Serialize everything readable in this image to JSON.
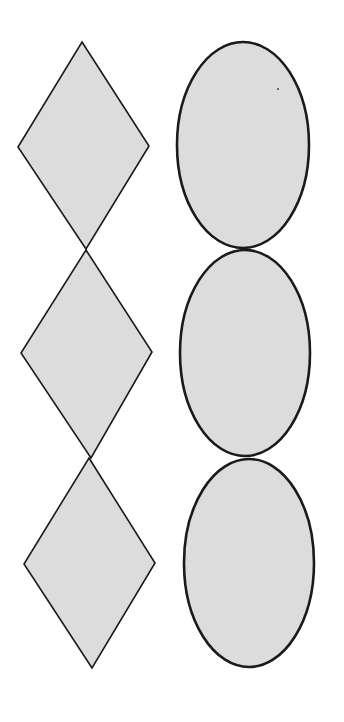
{
  "figure": {
    "colors": {
      "background": "#ffffff",
      "fill": "#dcdcdc",
      "stroke": "#1a1a1a"
    },
    "columns": [
      {
        "name": "diamonds",
        "shape": "diamond",
        "count": 3,
        "items": [
          {
            "top": [
              82,
              42
            ],
            "left": [
              18,
              147
            ],
            "right": [
              149,
              146
            ],
            "bottom": [
              86,
              249
            ]
          },
          {
            "top": [
              86,
              250
            ],
            "left": [
              21,
              353
            ],
            "right": [
              152,
              352
            ],
            "bottom": [
              91,
              458
            ]
          },
          {
            "top": [
              89,
              458
            ],
            "left": [
              24,
              564
            ],
            "right": [
              155,
              563
            ],
            "bottom": [
              92,
              668
            ]
          }
        ]
      },
      {
        "name": "ovals",
        "shape": "ellipse",
        "count": 3,
        "items": [
          {
            "cx": 243,
            "cy": 145,
            "rx": 66,
            "ry": 103
          },
          {
            "cx": 245,
            "cy": 353,
            "rx": 65,
            "ry": 103
          },
          {
            "cx": 249,
            "cy": 563,
            "rx": 65,
            "ry": 104
          }
        ]
      }
    ]
  }
}
